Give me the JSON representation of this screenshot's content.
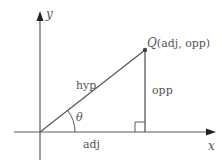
{
  "diagram": {
    "type": "right-triangle-trigonometry",
    "axes": {
      "x_label": "x",
      "y_label": "y"
    },
    "point": {
      "name": "Q",
      "coords_label": "(adj, opp)"
    },
    "sides": {
      "hypotenuse": "hyp",
      "adjacent": "adj",
      "opposite": "opp"
    },
    "angle_label": "θ",
    "colors": {
      "line": "#5a5a5a",
      "text": "#555555",
      "background": "#ffffff"
    }
  }
}
